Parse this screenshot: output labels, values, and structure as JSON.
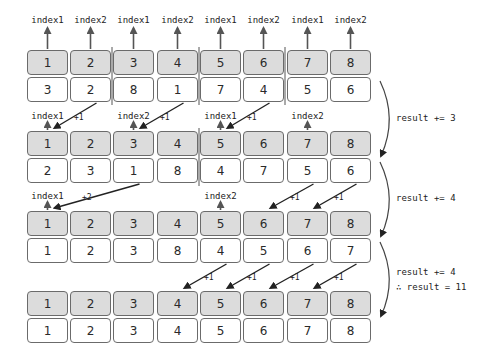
{
  "diagram": {
    "title": "",
    "colors": {
      "key_fill": "#dcdcdc",
      "value_fill": "#ffffff",
      "border": "#6b6b6b",
      "arrow": "#222222",
      "pointer_arrow": "#555555"
    },
    "steps": [
      {
        "keys": [
          "1",
          "2",
          "3",
          "4",
          "5",
          "6",
          "7",
          "8"
        ],
        "values": [
          "3",
          "2",
          "8",
          "1",
          "7",
          "4",
          "5",
          "6"
        ],
        "pointers": [
          {
            "col": 0,
            "label": "index1"
          },
          {
            "col": 1,
            "label": "index2"
          },
          {
            "col": 2,
            "label": "index1"
          },
          {
            "col": 3,
            "label": "index2"
          },
          {
            "col": 4,
            "label": "index1"
          },
          {
            "col": 5,
            "label": "index2"
          },
          {
            "col": 6,
            "label": "index1"
          },
          {
            "col": 7,
            "label": "index2"
          }
        ],
        "dividers_after_cols": [
          1,
          3,
          5
        ],
        "moves": [],
        "result_note": ""
      },
      {
        "keys": [
          "1",
          "2",
          "3",
          "4",
          "5",
          "6",
          "7",
          "8"
        ],
        "values": [
          "2",
          "3",
          "1",
          "8",
          "4",
          "7",
          "5",
          "6"
        ],
        "pointers": [
          {
            "col": 0,
            "label": "index1"
          },
          {
            "col": 2,
            "label": "index2"
          },
          {
            "col": 4,
            "label": "index1"
          },
          {
            "col": 6,
            "label": "index2"
          }
        ],
        "dividers_after_cols": [
          3
        ],
        "moves": [
          {
            "from": 1,
            "to": 0,
            "label": "+1"
          },
          {
            "from": 3,
            "to": 2,
            "label": "+1"
          },
          {
            "from": 5,
            "to": 4,
            "label": "+1"
          }
        ],
        "result_note": "result += 3"
      },
      {
        "keys": [
          "1",
          "2",
          "3",
          "4",
          "5",
          "6",
          "7",
          "8"
        ],
        "values": [
          "1",
          "2",
          "3",
          "8",
          "4",
          "5",
          "6",
          "7"
        ],
        "pointers": [
          {
            "col": 0,
            "label": "index1"
          },
          {
            "col": 4,
            "label": "index2"
          }
        ],
        "dividers_after_cols": [],
        "moves": [
          {
            "from": 2,
            "to": 0,
            "label": "+2"
          },
          {
            "from": 6,
            "to": 5,
            "label": "+1"
          },
          {
            "from": 7,
            "to": 6,
            "label": "+1"
          }
        ],
        "result_note": "result += 4"
      },
      {
        "keys": [
          "1",
          "2",
          "3",
          "4",
          "5",
          "6",
          "7",
          "8"
        ],
        "values": [
          "1",
          "2",
          "3",
          "4",
          "5",
          "6",
          "7",
          "8"
        ],
        "pointers": [],
        "dividers_after_cols": [],
        "moves": [
          {
            "from": 4,
            "to": 3,
            "label": "+1"
          },
          {
            "from": 5,
            "to": 4,
            "label": "+1"
          },
          {
            "from": 6,
            "to": 5,
            "label": "+1"
          },
          {
            "from": 7,
            "to": 6,
            "label": "+1"
          }
        ],
        "result_note": "result += 4",
        "conclusion": "∴ result = 11"
      }
    ]
  }
}
